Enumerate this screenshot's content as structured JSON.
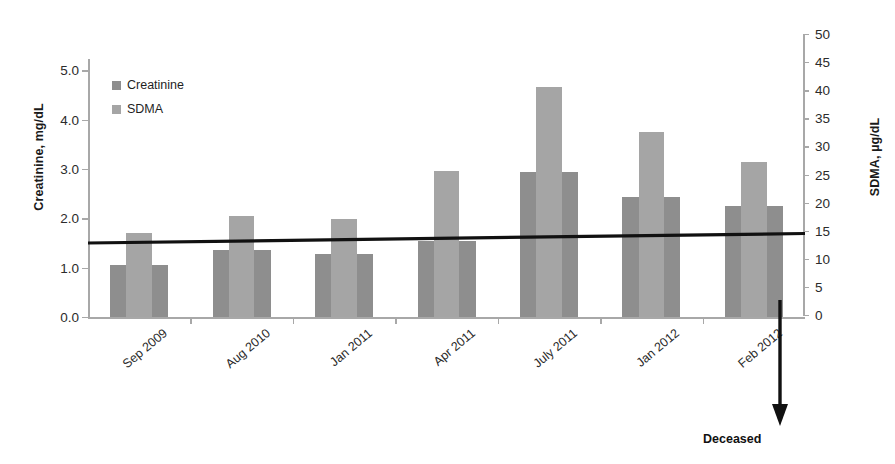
{
  "chart_data": {
    "type": "bar",
    "title": "",
    "categories": [
      "Sep 2009",
      "Aug 2010",
      "Jan 2011",
      "Apr 2011",
      "July 2011",
      "Jan 2012",
      "Feb 2012"
    ],
    "series": [
      {
        "name": "Creatinine",
        "axis": "left",
        "units": "mg/dL",
        "color": "#8e8e8e",
        "values": [
          1.05,
          1.35,
          1.27,
          1.55,
          2.93,
          2.44,
          2.25
        ]
      },
      {
        "name": "SDMA",
        "axis": "right",
        "units": "µg/dL",
        "color": "#a5a5a5",
        "values": [
          15,
          18,
          17.5,
          26,
          41,
          33,
          27.5
        ]
      }
    ],
    "xlabel": "",
    "ylabel": "Creatinine, mg/dL",
    "y2label": "SDMA, µg/dL",
    "ylim": [
      0.0,
      5.5
    ],
    "y2lim": [
      0,
      50
    ],
    "yticks": [
      "0.0",
      "1.0",
      "2.0",
      "3.0",
      "4.0",
      "5.0"
    ],
    "ytick_values": [
      0.0,
      1.0,
      2.0,
      3.0,
      4.0,
      5.0
    ],
    "y2ticks": [
      "0",
      "5",
      "10",
      "15",
      "20",
      "25",
      "30",
      "35",
      "40",
      "45",
      "50"
    ],
    "y2tick_values": [
      0,
      5,
      10,
      15,
      20,
      25,
      30,
      35,
      40,
      45,
      50
    ],
    "grid": false,
    "legend_position": "upper left",
    "legend": [
      "Creatinine",
      "SDMA"
    ],
    "reference_line": {
      "label": "",
      "left_axis_value": 1.5,
      "right_axis_value": 14.5,
      "color": "#111111"
    },
    "annotations": [
      {
        "name": "deceased",
        "text": "Deceased",
        "at_category": "Feb 2012",
        "marker": "down-arrow"
      }
    ]
  },
  "axes": {
    "left_title": "Creatinine, mg/dL",
    "right_title": "SDMA, µg/dL"
  },
  "legend": {
    "items": [
      {
        "label": "Creatinine",
        "color": "#8e8e8e"
      },
      {
        "label": "SDMA",
        "color": "#a5a5a5"
      }
    ]
  },
  "annotation": {
    "deceased_label": "Deceased"
  }
}
